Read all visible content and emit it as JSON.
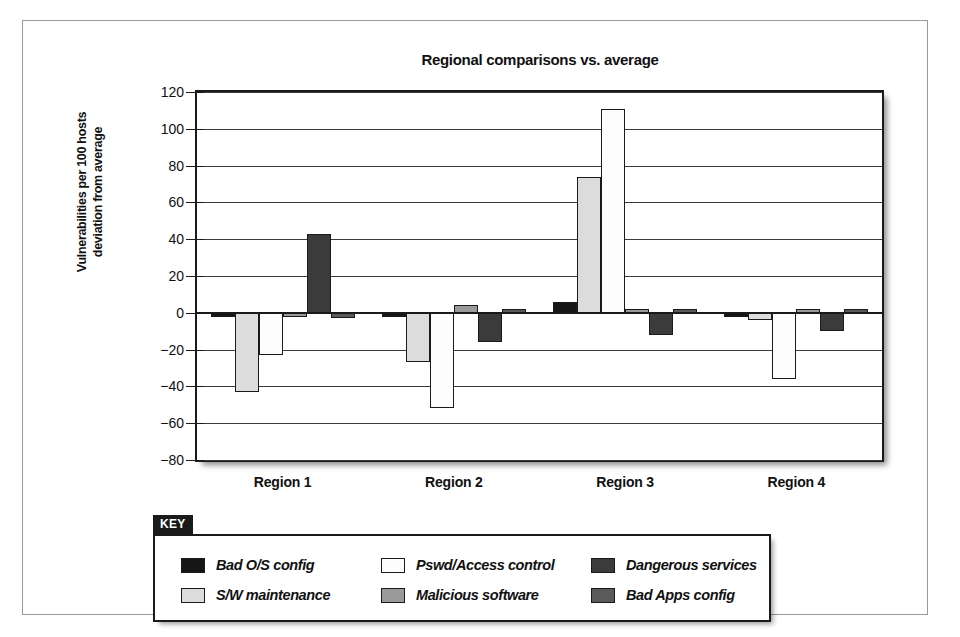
{
  "figure": {
    "legend_tab_label": "KEY"
  },
  "chart_data": {
    "type": "bar",
    "title": "Regional comparisons vs. average",
    "xlabel": "",
    "ylabel": "Vulnerabilities per 100 hosts deviation from average",
    "ylabel_line1": "Vulnerabilities per 100 hosts",
    "ylabel_line2": "deviation from average",
    "categories": [
      "Region 1",
      "Region 2",
      "Region 3",
      "Region 4"
    ],
    "ylim": [
      -80,
      120
    ],
    "ytick_step": 20,
    "ytick_labels": [
      "120",
      "100",
      "80",
      "60",
      "40",
      "20",
      "0",
      "−20",
      "−40",
      "−60",
      "−80"
    ],
    "ytick_values": [
      120,
      100,
      80,
      60,
      40,
      20,
      0,
      -20,
      -40,
      -60,
      -80
    ],
    "grid": true,
    "legend_position": "below-plot",
    "series": [
      {
        "name": "Bad O/S config",
        "color": "#161616",
        "values": [
          -1,
          -1,
          6,
          -1
        ]
      },
      {
        "name": "S/W maintenance",
        "color": "#dcdcdc",
        "values": [
          -43,
          -27,
          74,
          -4
        ]
      },
      {
        "name": "Pswd/Access control",
        "color": "#fdfdfd",
        "values": [
          -23,
          -52,
          111,
          -36
        ]
      },
      {
        "name": "Malicious software",
        "color": "#9a9a9a",
        "values": [
          -1,
          4,
          0,
          0
        ]
      },
      {
        "name": "Dangerous services",
        "color": "#3b3b3b",
        "values": [
          43,
          -16,
          -12,
          -10
        ]
      },
      {
        "name": "Bad Apps config",
        "color": "#5a5a5a",
        "values": [
          -3,
          0,
          0,
          2
        ]
      }
    ]
  }
}
